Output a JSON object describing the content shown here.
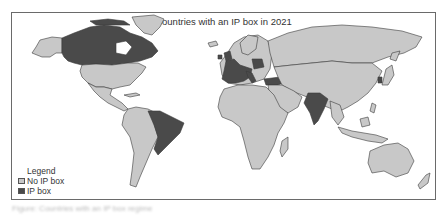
{
  "map": {
    "title": "Countries with an IP box in 2021",
    "year": 2021,
    "colors": {
      "no_ip_box": "#c8c8c8",
      "ip_box": "#4a4a4a",
      "border": "#3a3a3a",
      "ocean": "#ffffff"
    },
    "legend": {
      "title": "Legend",
      "items": [
        {
          "label": "No IP box",
          "color": "#c8c8c8"
        },
        {
          "label": "IP box",
          "color": "#4a4a4a"
        }
      ]
    },
    "highlighted_countries": [
      "Canada",
      "Brazil",
      "India",
      "United Kingdom",
      "Ireland",
      "France",
      "Spain",
      "Portugal",
      "Belgium",
      "Netherlands",
      "Luxembourg",
      "Switzerland",
      "Italy",
      "Poland",
      "Lithuania",
      "Hungary",
      "Slovakia",
      "Greece",
      "Cyprus",
      "Malta",
      "Turkey",
      "Israel",
      "Sri Lanka",
      "Korea",
      "Singapore"
    ]
  },
  "caption": {
    "text": "Figure: Countries with an IP box regime"
  }
}
